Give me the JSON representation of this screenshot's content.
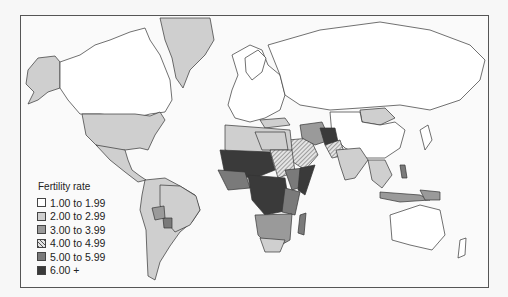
{
  "map": {
    "title": "Fertility rate",
    "legend": [
      {
        "label": "1.00 to 1.99",
        "fill": "#ffffff",
        "pattern": "solid"
      },
      {
        "label": "2.00 to 2.99",
        "fill": "#cfcfcf",
        "pattern": "solid"
      },
      {
        "label": "3.00 to 3.99",
        "fill": "#9a9a9a",
        "pattern": "solid"
      },
      {
        "label": "4.00 to 4.99",
        "fill": "#d8d8d8",
        "pattern": "hatched"
      },
      {
        "label": "5.00 to 5.99",
        "fill": "#7a7a7a",
        "pattern": "solid"
      },
      {
        "label": "6.00 +",
        "fill": "#3a3a3a",
        "pattern": "solid"
      }
    ],
    "colors": {
      "frame": "#555555",
      "ocean": "#fafafa",
      "outline": "#333333"
    }
  }
}
